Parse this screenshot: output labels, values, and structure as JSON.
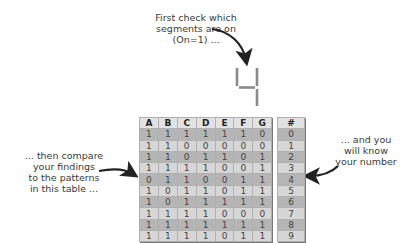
{
  "annotations": {
    "top": [
      "First check which",
      "segments are on",
      "(On=1) ..."
    ],
    "left": [
      "... then compare",
      "your findings",
      "to the patterns",
      "in this table ..."
    ],
    "right": [
      "... and you",
      "will know",
      "your number"
    ]
  },
  "display_digit": "4",
  "truth_table": {
    "headers": [
      "A",
      "B",
      "C",
      "D",
      "E",
      "F",
      "G"
    ],
    "rows": [
      [
        "1",
        "1",
        "1",
        "1",
        "1",
        "1",
        "0"
      ],
      [
        "1",
        "1",
        "0",
        "0",
        "0",
        "0",
        "0"
      ],
      [
        "1",
        "1",
        "0",
        "1",
        "1",
        "0",
        "1"
      ],
      [
        "1",
        "1",
        "1",
        "1",
        "0",
        "0",
        "1"
      ],
      [
        "0",
        "1",
        "1",
        "0",
        "0",
        "1",
        "1"
      ],
      [
        "1",
        "0",
        "1",
        "1",
        "0",
        "1",
        "1"
      ],
      [
        "1",
        "0",
        "1",
        "1",
        "1",
        "1",
        "1"
      ],
      [
        "1",
        "1",
        "1",
        "1",
        "0",
        "0",
        "0"
      ],
      [
        "1",
        "1",
        "1",
        "1",
        "1",
        "1",
        "1"
      ],
      [
        "1",
        "1",
        "1",
        "1",
        "0",
        "1",
        "1"
      ]
    ]
  },
  "number_table": {
    "header": "#",
    "values": [
      "0",
      "1",
      "2",
      "3",
      "4",
      "5",
      "6",
      "7",
      "8",
      "9"
    ]
  },
  "colors": {
    "row_dark": "#b5b5b5",
    "row_light": "#d6d6d6",
    "header": "#e2e2e2",
    "segment": "#8a8a8a",
    "arrow": "#222222"
  }
}
